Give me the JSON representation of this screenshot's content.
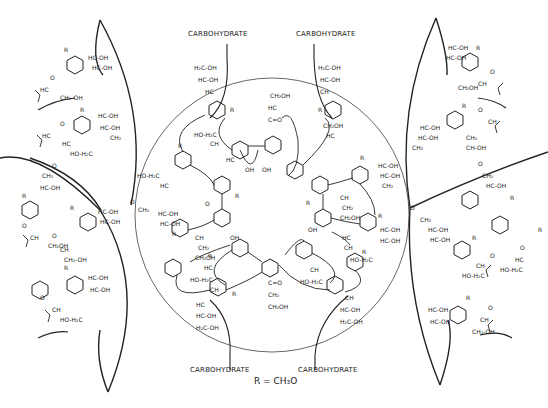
{
  "diagram": {
    "type": "chemical-structure",
    "carbohydrate_labels": [
      {
        "id": "top-left",
        "text": "CARBOHYDRATE"
      },
      {
        "id": "top-right",
        "text": "CARBOHYDRATE"
      },
      {
        "id": "bottom-left",
        "text": "CARBOHYDRATE"
      },
      {
        "id": "bottom-right",
        "text": "CARBOHYDRATE"
      }
    ],
    "legend": {
      "text": "R = CH₃O"
    },
    "groups": {
      "r": "R",
      "oh": "OH",
      "ch2oh": "CH₂OH",
      "hc": "HC",
      "ch": "CH",
      "co": "C=O",
      "ch2": "CH₂",
      "h2c_oh": "H₂C-OH",
      "hc_oh": "HC-OH",
      "ho_h2c": "HO-H₂C",
      "o": "O"
    },
    "regions": [
      "central-circle",
      "upper-left-lens",
      "lower-left-lens",
      "upper-right-lens",
      "lower-right-lens"
    ]
  }
}
